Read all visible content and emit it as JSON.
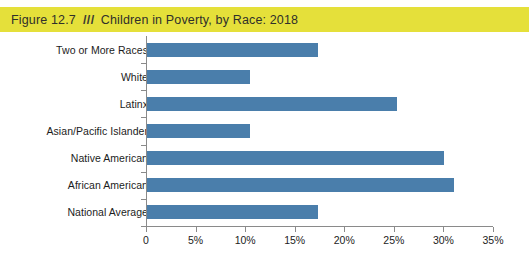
{
  "figure": {
    "label": "Figure 12.7",
    "separator": "///",
    "title": "Children in Poverty, by Race: 2018",
    "band_color": "#e5e03a"
  },
  "chart_data": {
    "type": "bar",
    "orientation": "horizontal",
    "title": "Children in Poverty, by Race: 2018",
    "xlabel": "",
    "ylabel": "",
    "xlim": [
      0,
      35
    ],
    "xtick_labels": [
      "0",
      "5%",
      "10%",
      "15%",
      "20%",
      "25%",
      "30%",
      "35%"
    ],
    "xticks": [
      0,
      5,
      10,
      15,
      20,
      25,
      30,
      35
    ],
    "grid": false,
    "legend": null,
    "bar_color": "#4a7eab",
    "categories": [
      "Two or More Races",
      "White",
      "Latinx",
      "Asian/Pacific Islander",
      "Native American",
      "African American",
      "National Average"
    ],
    "values": [
      17.2,
      10.4,
      25.2,
      10.4,
      30.0,
      31.0,
      17.2
    ],
    "value_unit": "%"
  }
}
